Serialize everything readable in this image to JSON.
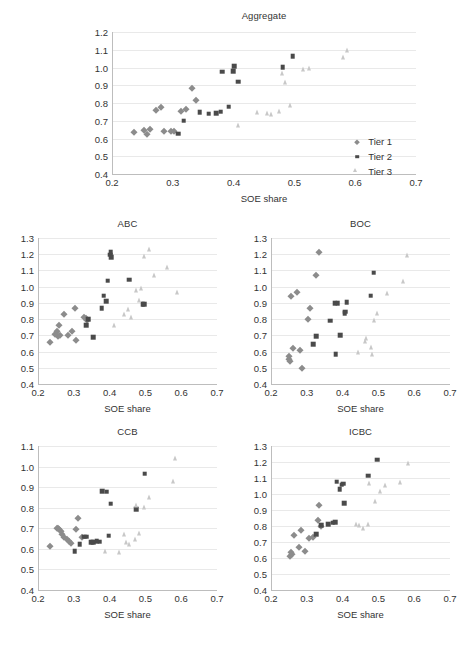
{
  "figure": {
    "caption": ""
  },
  "legend": {
    "items": [
      {
        "label": "Tier 1",
        "marker": "diamond",
        "color": "#8c8c8c"
      },
      {
        "label": "Tier 2",
        "marker": "square",
        "color": "#4a4a4a"
      },
      {
        "label": "Tier 3",
        "marker": "triangle",
        "color": "#c8c8c8"
      }
    ]
  },
  "colors": {
    "tier1": "#8c8c8c",
    "tier2": "#4a4a4a",
    "tier3": "#c8c8c8",
    "grid": "#e9e9e9",
    "axis": "#bdbdbd",
    "text": "#333333"
  },
  "chart_data": [
    {
      "type": "scatter",
      "title": "Aggregate",
      "xlabel": "SOE share",
      "ylabel": "",
      "xlim": [
        0.2,
        0.7
      ],
      "ylim": [
        0.4,
        1.2
      ],
      "xticks": [
        "0.2",
        "0.3",
        "0.4",
        "0.5",
        "0.6",
        "0.7"
      ],
      "yticks": [
        "0.4",
        "0.5",
        "0.6",
        "0.7",
        "0.8",
        "0.9",
        "1.0",
        "1.1",
        "1.2"
      ],
      "grid": true,
      "legend_position": "bottom-right",
      "series": [
        {
          "name": "Tier 1",
          "marker": "diamond",
          "color": "#8c8c8c",
          "points": [
            [
              0.236,
              0.637
            ],
            [
              0.252,
              0.646
            ],
            [
              0.258,
              0.627
            ],
            [
              0.262,
              0.651
            ],
            [
              0.272,
              0.759
            ],
            [
              0.281,
              0.776
            ],
            [
              0.285,
              0.643
            ],
            [
              0.297,
              0.645
            ],
            [
              0.302,
              0.641
            ],
            [
              0.313,
              0.757
            ],
            [
              0.322,
              0.767
            ],
            [
              0.332,
              0.884
            ],
            [
              0.338,
              0.818
            ]
          ]
        },
        {
          "name": "Tier 2",
          "marker": "square",
          "color": "#4a4a4a",
          "points": [
            [
              0.309,
              0.627
            ],
            [
              0.318,
              0.7
            ],
            [
              0.344,
              0.747
            ],
            [
              0.359,
              0.739
            ],
            [
              0.371,
              0.742
            ],
            [
              0.379,
              0.75
            ],
            [
              0.381,
              0.976
            ],
            [
              0.392,
              0.778
            ],
            [
              0.399,
              0.979
            ],
            [
              0.401,
              1.006
            ],
            [
              0.408,
              0.921
            ],
            [
              0.481,
              1.001
            ],
            [
              0.497,
              1.064
            ]
          ]
        },
        {
          "name": "Tier 3",
          "marker": "triangle",
          "color": "#c8c8c8",
          "points": [
            [
              0.412,
              0.662
            ],
            [
              0.443,
              0.737
            ],
            [
              0.459,
              0.729
            ],
            [
              0.467,
              0.722
            ],
            [
              0.479,
              0.742
            ],
            [
              0.485,
              0.953
            ],
            [
              0.489,
              0.905
            ],
            [
              0.498,
              0.776
            ],
            [
              0.519,
              0.979
            ],
            [
              0.529,
              0.982
            ],
            [
              0.585,
              1.045
            ],
            [
              0.592,
              1.082
            ]
          ]
        }
      ]
    },
    {
      "type": "scatter",
      "title": "ABC",
      "xlabel": "SOE share",
      "ylabel": "",
      "xlim": [
        0.2,
        0.7
      ],
      "ylim": [
        0.4,
        1.3
      ],
      "xticks": [
        "0.2",
        "0.3",
        "0.4",
        "0.5",
        "0.6",
        "0.7"
      ],
      "yticks": [
        "0.4",
        "0.5",
        "0.6",
        "0.7",
        "0.8",
        "0.9",
        "1.0",
        "1.1",
        "1.2",
        "1.3"
      ],
      "grid": true,
      "series": [
        {
          "name": "Tier 1",
          "marker": "diamond",
          "color": "#8c8c8c",
          "points": [
            [
              0.233,
              0.66
            ],
            [
              0.248,
              0.706
            ],
            [
              0.252,
              0.724
            ],
            [
              0.256,
              0.698
            ],
            [
              0.259,
              0.766
            ],
            [
              0.262,
              0.702
            ],
            [
              0.272,
              0.829
            ],
            [
              0.283,
              0.704
            ],
            [
              0.296,
              0.725
            ],
            [
              0.303,
              0.871
            ],
            [
              0.307,
              0.67
            ],
            [
              0.329,
              0.812
            ],
            [
              0.333,
              0.805
            ],
            [
              0.337,
              0.796
            ]
          ]
        },
        {
          "name": "Tier 2",
          "marker": "square",
          "color": "#4a4a4a",
          "points": [
            [
              0.334,
              0.761
            ],
            [
              0.341,
              0.8
            ],
            [
              0.355,
              0.688
            ],
            [
              0.378,
              0.866
            ],
            [
              0.383,
              0.944
            ],
            [
              0.39,
              0.909
            ],
            [
              0.395,
              1.038
            ],
            [
              0.402,
              1.196
            ],
            [
              0.403,
              1.211
            ],
            [
              0.404,
              1.18
            ],
            [
              0.455,
              1.043
            ],
            [
              0.492,
              0.893
            ],
            [
              0.497,
              0.893
            ]
          ]
        },
        {
          "name": "Tier 3",
          "marker": "triangle",
          "color": "#c8c8c8",
          "points": [
            [
              0.421,
              0.747
            ],
            [
              0.447,
              0.815
            ],
            [
              0.459,
              0.845
            ],
            [
              0.468,
              0.797
            ],
            [
              0.483,
              0.963
            ],
            [
              0.489,
              0.899
            ],
            [
              0.497,
              0.974
            ],
            [
              0.503,
              1.176
            ],
            [
              0.519,
              1.214
            ],
            [
              0.533,
              1.058
            ],
            [
              0.569,
              1.107
            ],
            [
              0.597,
              0.953
            ]
          ]
        }
      ]
    },
    {
      "type": "scatter",
      "title": "BOC",
      "xlabel": "SOE share",
      "ylabel": "",
      "xlim": [
        0.2,
        0.7
      ],
      "ylim": [
        0.4,
        1.3
      ],
      "xticks": [
        "0.2",
        "0.3",
        "0.4",
        "0.5",
        "0.6",
        "0.7"
      ],
      "yticks": [
        "0.4",
        "0.5",
        "0.6",
        "0.7",
        "0.8",
        "0.9",
        "1.0",
        "1.1",
        "1.2",
        "1.3"
      ],
      "grid": true,
      "series": [
        {
          "name": "Tier 1",
          "marker": "diamond",
          "color": "#8c8c8c",
          "points": [
            [
              0.25,
              0.57
            ],
            [
              0.251,
              0.556
            ],
            [
              0.253,
              0.54
            ],
            [
              0.255,
              0.941
            ],
            [
              0.262,
              0.625
            ],
            [
              0.272,
              0.968
            ],
            [
              0.282,
              0.61
            ],
            [
              0.286,
              0.501
            ],
            [
              0.303,
              0.801
            ],
            [
              0.309,
              0.869
            ],
            [
              0.327,
              1.07
            ],
            [
              0.333,
              1.214
            ]
          ]
        },
        {
          "name": "Tier 2",
          "marker": "square",
          "color": "#4a4a4a",
          "points": [
            [
              0.318,
              0.646
            ],
            [
              0.327,
              0.693
            ],
            [
              0.366,
              0.79
            ],
            [
              0.378,
              0.897
            ],
            [
              0.381,
              0.584
            ],
            [
              0.386,
              0.898
            ],
            [
              0.394,
              0.701
            ],
            [
              0.406,
              0.836
            ],
            [
              0.408,
              0.845
            ],
            [
              0.411,
              0.903
            ],
            [
              0.478,
              0.944
            ],
            [
              0.487,
              1.085
            ]
          ]
        },
        {
          "name": "Tier 3",
          "marker": "triangle",
          "color": "#c8c8c8",
          "points": [
            [
              0.452,
              0.582
            ],
            [
              0.47,
              0.648
            ],
            [
              0.474,
              0.665
            ],
            [
              0.487,
              0.612
            ],
            [
              0.489,
              0.571
            ],
            [
              0.495,
              0.779
            ],
            [
              0.504,
              0.821
            ],
            [
              0.531,
              0.944
            ],
            [
              0.578,
              1.022
            ],
            [
              0.589,
              1.178
            ]
          ]
        }
      ]
    },
    {
      "type": "scatter",
      "title": "CCB",
      "xlabel": "SOE share",
      "ylabel": "",
      "xlim": [
        0.2,
        0.7
      ],
      "ylim": [
        0.4,
        1.1
      ],
      "xticks": [
        "0.2",
        "0.3",
        "0.4",
        "0.5",
        "0.6",
        "0.7"
      ],
      "yticks": [
        "0.4",
        "0.5",
        "0.6",
        "0.7",
        "0.8",
        "0.9",
        "1.0",
        "1.1"
      ],
      "grid": true,
      "series": [
        {
          "name": "Tier 1",
          "marker": "diamond",
          "color": "#8c8c8c",
          "points": [
            [
              0.233,
              0.616
            ],
            [
              0.253,
              0.7
            ],
            [
              0.256,
              0.703
            ],
            [
              0.259,
              0.697
            ],
            [
              0.263,
              0.686
            ],
            [
              0.268,
              0.672
            ],
            [
              0.273,
              0.66
            ],
            [
              0.28,
              0.648
            ],
            [
              0.286,
              0.637
            ],
            [
              0.292,
              0.628
            ],
            [
              0.305,
              0.698
            ],
            [
              0.313,
              0.75
            ],
            [
              0.322,
              0.658
            ]
          ]
        },
        {
          "name": "Tier 2",
          "marker": "square",
          "color": "#4a4a4a",
          "points": [
            [
              0.302,
              0.588
            ],
            [
              0.317,
              0.623
            ],
            [
              0.329,
              0.659
            ],
            [
              0.335,
              0.66
            ],
            [
              0.348,
              0.632
            ],
            [
              0.355,
              0.632
            ],
            [
              0.364,
              0.636
            ],
            [
              0.372,
              0.634
            ],
            [
              0.379,
              0.88
            ],
            [
              0.392,
              0.877
            ],
            [
              0.398,
              0.663
            ],
            [
              0.403,
              0.82
            ],
            [
              0.475,
              0.793
            ],
            [
              0.498,
              0.965
            ]
          ]
        },
        {
          "name": "Tier 3",
          "marker": "triangle",
          "color": "#c8c8c8",
          "points": [
            [
              0.396,
              0.578
            ],
            [
              0.434,
              0.573
            ],
            [
              0.448,
              0.658
            ],
            [
              0.455,
              0.62
            ],
            [
              0.462,
              0.612
            ],
            [
              0.479,
              0.637
            ],
            [
              0.483,
              0.803
            ],
            [
              0.491,
              0.664
            ],
            [
              0.503,
              0.79
            ],
            [
              0.518,
              0.841
            ],
            [
              0.584,
              0.915
            ],
            [
              0.592,
              1.03
            ]
          ]
        }
      ]
    },
    {
      "type": "scatter",
      "title": "ICBC",
      "xlabel": "SOE share",
      "ylabel": "",
      "xlim": [
        0.2,
        0.7
      ],
      "ylim": [
        0.4,
        1.3
      ],
      "xticks": [
        "0.2",
        "0.3",
        "0.4",
        "0.5",
        "0.6",
        "0.7"
      ],
      "yticks": [
        "0.4",
        "0.5",
        "0.6",
        "0.7",
        "0.8",
        "0.9",
        "1.0",
        "1.1",
        "1.2",
        "1.3"
      ],
      "grid": true,
      "series": [
        {
          "name": "Tier 1",
          "marker": "diamond",
          "color": "#8c8c8c",
          "points": [
            [
              0.254,
              0.61
            ],
            [
              0.256,
              0.64
            ],
            [
              0.259,
              0.627
            ],
            [
              0.263,
              0.744
            ],
            [
              0.279,
              0.669
            ],
            [
              0.283,
              0.772
            ],
            [
              0.296,
              0.641
            ],
            [
              0.305,
              0.726
            ],
            [
              0.316,
              0.73
            ],
            [
              0.33,
              0.836
            ],
            [
              0.334,
              0.929
            ],
            [
              0.339,
              0.801
            ]
          ]
        },
        {
          "name": "Tier 2",
          "marker": "square",
          "color": "#4a4a4a",
          "points": [
            [
              0.327,
              0.748
            ],
            [
              0.341,
              0.806
            ],
            [
              0.36,
              0.812
            ],
            [
              0.372,
              0.82
            ],
            [
              0.379,
              0.822
            ],
            [
              0.383,
              1.076
            ],
            [
              0.392,
              1.03
            ],
            [
              0.397,
              1.058
            ],
            [
              0.401,
              1.065
            ],
            [
              0.404,
              0.943
            ],
            [
              0.472,
              1.114
            ],
            [
              0.496,
              1.214
            ]
          ]
        },
        {
          "name": "Tier 3",
          "marker": "triangle",
          "color": "#c8c8c8",
          "points": [
            [
              0.446,
              0.797
            ],
            [
              0.455,
              0.79
            ],
            [
              0.466,
              0.772
            ],
            [
              0.478,
              0.799
            ],
            [
              0.481,
              1.051
            ],
            [
              0.498,
              0.941
            ],
            [
              0.512,
              1.002
            ],
            [
              0.527,
              1.041
            ],
            [
              0.568,
              1.061
            ],
            [
              0.592,
              1.177
            ]
          ]
        }
      ]
    }
  ]
}
